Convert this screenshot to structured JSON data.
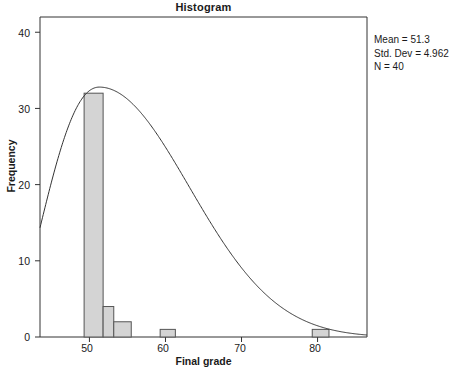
{
  "chart_data": {
    "type": "bar",
    "title": "Histogram",
    "xlabel": "Final grade",
    "ylabel": "Frequency",
    "xlim": [
      43.5,
      86.5
    ],
    "ylim": [
      0,
      42
    ],
    "grid": false,
    "legend": "none",
    "bin_width": 2.5,
    "categories": [
      "50",
      "52.5",
      "55",
      "60",
      "80"
    ],
    "bin_starts": [
      49.3,
      51.8,
      53.2,
      59.3,
      79.3
    ],
    "bin_ends": [
      51.8,
      53.2,
      55.5,
      61.3,
      81.5
    ],
    "values": [
      32,
      4,
      2,
      1,
      1
    ],
    "xticks": [
      50,
      60,
      70,
      80
    ],
    "yticks": [
      0,
      10,
      20,
      30,
      40
    ],
    "overlay": {
      "type": "normal-curve",
      "mean": 51.3,
      "std_dev": 4.962,
      "n": 40,
      "peak_frequency": 32.8
    },
    "annotations": [
      "Mean = 51.3",
      "Std. Dev = 4.962",
      "N = 40"
    ],
    "colors": {
      "bar_fill": "#d4d4d4",
      "bar_edge": "#555555",
      "axis": "#333333",
      "curve": "#333333",
      "text": "#1a1a1a"
    }
  },
  "stats": {
    "mean": "Mean = 51.3",
    "std_dev": "Std. Dev = 4.962",
    "n": "N = 40"
  },
  "yticks": [
    {
      "label": "40"
    },
    {
      "label": "30"
    },
    {
      "label": "20"
    },
    {
      "label": "10"
    },
    {
      "label": "0"
    }
  ],
  "xticks": [
    {
      "label": "50"
    },
    {
      "label": "60"
    },
    {
      "label": "70"
    },
    {
      "label": "80"
    }
  ]
}
